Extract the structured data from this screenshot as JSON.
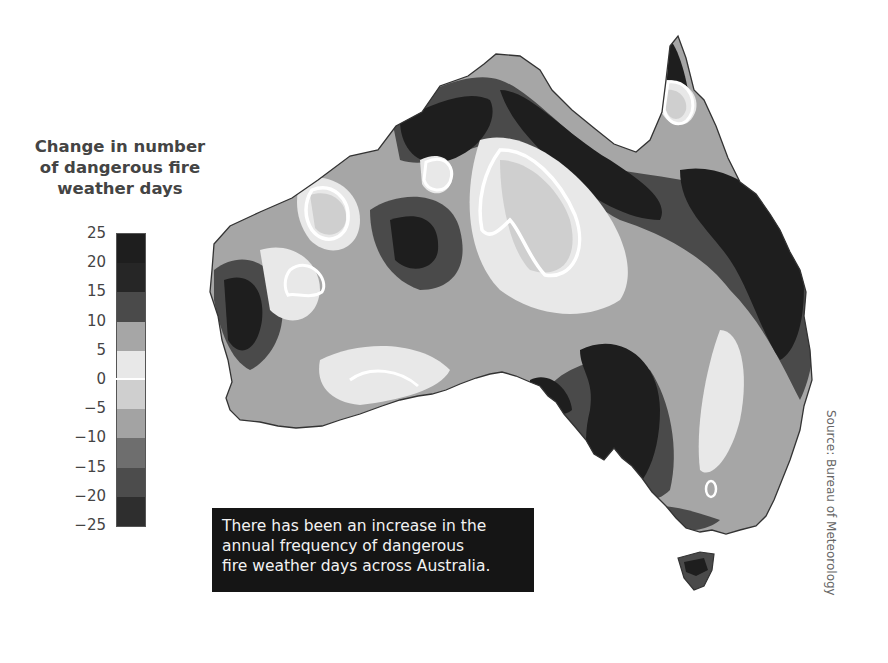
{
  "legend": {
    "title_lines": [
      "Change in number",
      "of dangerous fire",
      "weather days"
    ],
    "ticks": [
      "25",
      "20",
      "15",
      "10",
      "5",
      "0",
      "−5",
      "−10",
      "−15",
      "−20",
      "−25"
    ],
    "bands": [
      {
        "range": "20 to 25",
        "color": "#1e1e1e"
      },
      {
        "range": "15 to 20",
        "color": "#262626"
      },
      {
        "range": "10 to 15",
        "color": "#4a4a4a"
      },
      {
        "range": "5 to 10",
        "color": "#a6a6a6"
      },
      {
        "range": "0 to 5",
        "color": "#e8e8e8"
      },
      {
        "range": "-5 to 0",
        "color": "#cfcfcf"
      },
      {
        "range": "-10 to -5",
        "color": "#a3a3a3"
      },
      {
        "range": "-15 to -10",
        "color": "#6e6e6e"
      },
      {
        "range": "-20 to -15",
        "color": "#4c4c4c"
      },
      {
        "range": "-25 to -20",
        "color": "#2e2e2e"
      }
    ]
  },
  "map": {
    "region": "Australia",
    "variable": "Change in number of dangerous fire weather days",
    "colors": {
      "darkest": "#1e1e1e",
      "dark": "#4a4a4a",
      "mid": "#a6a6a6",
      "light": "#cfcfcf",
      "lightest": "#e8e8e8",
      "contour": "#ffffff",
      "outline": "#333333"
    }
  },
  "caption": {
    "lines": [
      "There has been an increase in the",
      "annual frequency of dangerous",
      "fire weather days across Australia."
    ]
  },
  "source": "Source: Bureau of Meteorology"
}
